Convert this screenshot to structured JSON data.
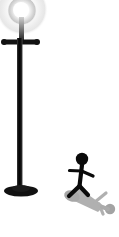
{
  "scene": {
    "title": "Street lamp and running stick figure",
    "width": 119,
    "height": 237,
    "background_color": "#ffffff"
  },
  "lamp": {
    "label": "street-lamp",
    "post_color": "#111111",
    "bulb": {
      "label": "glowing lamp bulb",
      "center_x": 22,
      "center_y": 12,
      "radius": 13,
      "core_color": "#ffffff",
      "glow_color": "#bdbdbd"
    },
    "neck": {
      "label": "bulb neck",
      "x": 19,
      "y": 18,
      "width": 5,
      "height": 22,
      "color": "#3d3d3d"
    },
    "crossbar": {
      "label": "lamp crossbar",
      "x_start": 3,
      "x_end": 38,
      "y": 42,
      "thickness": 5,
      "knob_radius": 3,
      "color": "#111111"
    },
    "pole": {
      "label": "lamp pole",
      "x": 17,
      "y_top": 38,
      "y_bottom": 190,
      "width": 5,
      "color": "#111111"
    },
    "base": {
      "label": "lamp base disc",
      "center_x": 21,
      "center_y": 191,
      "radius_x": 17,
      "radius_y": 5,
      "color": "#111111"
    }
  },
  "figure": {
    "label": "running stick figure",
    "color": "#0a0a0a",
    "head": {
      "center_x": 82,
      "center_y": 159,
      "radius": 6
    },
    "torso": {
      "x1": 82,
      "y1": 165,
      "x2": 80,
      "y2": 185,
      "thickness": 4
    },
    "arm_front": {
      "x1": 81,
      "y1": 171,
      "x2": 92,
      "y2": 177,
      "thickness": 3
    },
    "arm_back": {
      "x1": 81,
      "y1": 171,
      "x2": 70,
      "y2": 170,
      "thickness": 3
    },
    "leg_front": {
      "x1": 80,
      "y1": 185,
      "x2": 89,
      "y2": 194,
      "thickness": 4
    },
    "leg_back": {
      "x1": 80,
      "y1": 185,
      "x2": 70,
      "y2": 196,
      "thickness": 4
    }
  },
  "shadow": {
    "label": "cast shadow of stick figure",
    "color": "#a6a6a6",
    "opacity": 0.85,
    "direction": "down-right",
    "head": {
      "center_x": 110,
      "center_y": 209,
      "radius": 5
    },
    "body": {
      "x1": 72,
      "y1": 192,
      "x2": 107,
      "y2": 208,
      "thickness": 9
    },
    "limb_a": {
      "x1": 92,
      "y1": 200,
      "x2": 101,
      "y2": 193,
      "thickness": 3
    },
    "limb_b": {
      "x1": 95,
      "y1": 202,
      "x2": 101,
      "y2": 212,
      "thickness": 3
    },
    "foot_blob": {
      "center_x": 74,
      "center_y": 196,
      "radius_x": 7,
      "radius_y": 5
    }
  }
}
